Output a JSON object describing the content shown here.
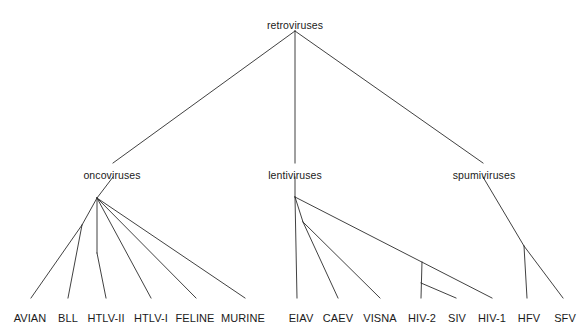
{
  "figure": {
    "name": "retrovirus-phylogenetic-tree",
    "width": 587,
    "height": 331,
    "background_color": "#ffffff",
    "line_color": "#2b2b2b",
    "text_color": "#1a1a1a"
  },
  "chart_data": {
    "type": "tree",
    "title": "",
    "root": "retroviruses",
    "nodes": [
      {
        "id": "retroviruses",
        "label": "retroviruses",
        "rank": "root",
        "x": 295,
        "y": 20,
        "label_anchor": "middle"
      },
      {
        "id": "oncoviruses",
        "label": "oncoviruses",
        "rank": "genus",
        "x": 112,
        "y": 170,
        "label_anchor": "middle"
      },
      {
        "id": "lentiviruses",
        "label": "lentiviruses",
        "rank": "genus",
        "x": 295,
        "y": 170,
        "label_anchor": "middle"
      },
      {
        "id": "spumiviruses",
        "label": "spumiviruses",
        "rank": "genus",
        "x": 484,
        "y": 170,
        "label_anchor": "middle"
      },
      {
        "id": "AVIAN",
        "label": "AVIAN",
        "rank": "leaf",
        "x": 30,
        "y": 313,
        "label_anchor": "middle"
      },
      {
        "id": "BLL",
        "label": "BLL",
        "rank": "leaf",
        "x": 68,
        "y": 313,
        "label_anchor": "middle"
      },
      {
        "id": "HTLV-II",
        "label": "HTLV-II",
        "rank": "leaf",
        "x": 106,
        "y": 313,
        "label_anchor": "middle"
      },
      {
        "id": "HTLV-I",
        "label": "HTLV-I",
        "rank": "leaf",
        "x": 151,
        "y": 313,
        "label_anchor": "middle"
      },
      {
        "id": "FELINE",
        "label": "FELINE",
        "rank": "leaf",
        "x": 195,
        "y": 313,
        "label_anchor": "middle"
      },
      {
        "id": "MURINE",
        "label": "MURINE",
        "rank": "leaf",
        "x": 243,
        "y": 313,
        "label_anchor": "middle"
      },
      {
        "id": "EIAV",
        "label": "EIAV",
        "rank": "leaf",
        "x": 301,
        "y": 313,
        "label_anchor": "middle"
      },
      {
        "id": "CAEV",
        "label": "CAEV",
        "rank": "leaf",
        "x": 338,
        "y": 313,
        "label_anchor": "middle"
      },
      {
        "id": "VISNA",
        "label": "VISNA",
        "rank": "leaf",
        "x": 380,
        "y": 313,
        "label_anchor": "middle"
      },
      {
        "id": "HIV-2",
        "label": "HIV-2",
        "rank": "leaf",
        "x": 422,
        "y": 313,
        "label_anchor": "middle"
      },
      {
        "id": "SIV",
        "label": "SIV",
        "rank": "leaf",
        "x": 457,
        "y": 313,
        "label_anchor": "middle"
      },
      {
        "id": "HIV-1",
        "label": "HIV-1",
        "rank": "leaf",
        "x": 492,
        "y": 313,
        "label_anchor": "middle"
      },
      {
        "id": "HFV",
        "label": "HFV",
        "rank": "leaf",
        "x": 529,
        "y": 313,
        "label_anchor": "middle"
      },
      {
        "id": "SFV",
        "label": "SFV",
        "rank": "leaf",
        "x": 565,
        "y": 313,
        "label_anchor": "middle"
      }
    ],
    "edges": [
      {
        "from": "retroviruses",
        "to": "oncoviruses",
        "x1": 295,
        "y1": 31,
        "x2": 113,
        "y2": 163
      },
      {
        "from": "retroviruses",
        "to": "lentiviruses",
        "x1": 295,
        "y1": 31,
        "x2": 295,
        "y2": 163
      },
      {
        "from": "retroviruses",
        "to": "spumiviruses",
        "x1": 295,
        "y1": 31,
        "x2": 483,
        "y2": 163
      },
      {
        "from": "oncoviruses",
        "to": "onco-node",
        "x1": 113,
        "y1": 177,
        "x2": 97,
        "y2": 198
      },
      {
        "from": "onco-node",
        "to": "avian-bll-node",
        "x1": 97,
        "y1": 198,
        "x2": 82,
        "y2": 225
      },
      {
        "from": "avian-bll-node",
        "to": "AVIAN",
        "x1": 82,
        "y1": 225,
        "x2": 31,
        "y2": 298
      },
      {
        "from": "avian-bll-node",
        "to": "BLL",
        "x1": 82,
        "y1": 225,
        "x2": 68,
        "y2": 298
      },
      {
        "from": "onco-node",
        "to": "htlv-node",
        "x1": 97,
        "y1": 198,
        "x2": 97,
        "y2": 253
      },
      {
        "from": "htlv-node",
        "to": "HTLV-II",
        "x1": 97,
        "y1": 253,
        "x2": 106,
        "y2": 298
      },
      {
        "from": "onco-node",
        "to": "HTLV-I",
        "x1": 97,
        "y1": 198,
        "x2": 151,
        "y2": 298
      },
      {
        "from": "onco-node",
        "to": "FELINE",
        "x1": 97,
        "y1": 198,
        "x2": 196,
        "y2": 298
      },
      {
        "from": "onco-node",
        "to": "MURINE",
        "x1": 97,
        "y1": 198,
        "x2": 245,
        "y2": 298
      },
      {
        "from": "lentiviruses",
        "to": "lenti-node",
        "x1": 295,
        "y1": 177,
        "x2": 295,
        "y2": 197
      },
      {
        "from": "lenti-node",
        "to": "EIAV",
        "x1": 295,
        "y1": 197,
        "x2": 297,
        "y2": 298
      },
      {
        "from": "lenti-node",
        "to": "caev-visna-node",
        "x1": 295,
        "y1": 197,
        "x2": 303,
        "y2": 222
      },
      {
        "from": "caev-visna-node",
        "to": "CAEV",
        "x1": 303,
        "y1": 222,
        "x2": 338,
        "y2": 298
      },
      {
        "from": "caev-visna-node",
        "to": "VISNA",
        "x1": 303,
        "y1": 222,
        "x2": 380,
        "y2": 298
      },
      {
        "from": "lenti-node",
        "to": "HIV-1",
        "x1": 295,
        "y1": 197,
        "x2": 492,
        "y2": 298
      },
      {
        "from": "hiv-node",
        "to": "HIV-2",
        "x1": 422,
        "y1": 262,
        "x2": 421,
        "y2": 298
      },
      {
        "from": "hiv2-siv-node",
        "to": "SIV",
        "x1": 421,
        "y1": 283,
        "x2": 456,
        "y2": 298
      },
      {
        "from": "spumiviruses",
        "to": "spumi-node",
        "x1": 483,
        "y1": 177,
        "x2": 524,
        "y2": 246
      },
      {
        "from": "spumi-node",
        "to": "HFV",
        "x1": 524,
        "y1": 246,
        "x2": 527,
        "y2": 298
      },
      {
        "from": "spumi-node",
        "to": "SFV",
        "x1": 524,
        "y1": 246,
        "x2": 563,
        "y2": 298
      }
    ],
    "leaf_groups": [
      {
        "parent": "oncoviruses",
        "leaves": [
          "AVIAN",
          "BLL",
          "HTLV-II",
          "HTLV-I",
          "FELINE",
          "MURINE"
        ]
      },
      {
        "parent": "lentiviruses",
        "leaves": [
          "EIAV",
          "CAEV",
          "VISNA",
          "HIV-2",
          "SIV",
          "HIV-1"
        ]
      },
      {
        "parent": "spumiviruses",
        "leaves": [
          "HFV",
          "SFV"
        ]
      }
    ]
  }
}
